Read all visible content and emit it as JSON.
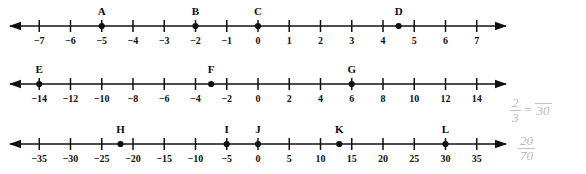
{
  "worksheet": {
    "title": "Number lines with labeled points",
    "ink_color": "#111111",
    "note_color": "#b9b9b9"
  },
  "number_lines": [
    {
      "id": "line-1",
      "top": 4,
      "min": -8,
      "max": 8,
      "tick_step": 1,
      "left_arrow": true,
      "right_arrow": true,
      "ticks": [
        {
          "value": -7,
          "label": "−7"
        },
        {
          "value": -6,
          "label": "−6"
        },
        {
          "value": -5,
          "label": "−5"
        },
        {
          "value": -4,
          "label": "−4"
        },
        {
          "value": -3,
          "label": "−3"
        },
        {
          "value": -2,
          "label": "−2"
        },
        {
          "value": -1,
          "label": "−1"
        },
        {
          "value": 0,
          "label": "0"
        },
        {
          "value": 1,
          "label": "1"
        },
        {
          "value": 2,
          "label": "2"
        },
        {
          "value": 3,
          "label": "3"
        },
        {
          "value": 4,
          "label": "4"
        },
        {
          "value": 5,
          "label": "5"
        },
        {
          "value": 6,
          "label": "6"
        },
        {
          "value": 7,
          "label": "7"
        }
      ],
      "points": [
        {
          "label": "A",
          "value": -5
        },
        {
          "label": "B",
          "value": -2
        },
        {
          "label": "C",
          "value": 0
        },
        {
          "label": "D",
          "value": 4.5
        }
      ]
    },
    {
      "id": "line-2",
      "top": 62,
      "min": -16,
      "max": 16,
      "tick_step": 2,
      "left_arrow": true,
      "right_arrow": true,
      "ticks": [
        {
          "value": -14,
          "label": "−14"
        },
        {
          "value": -12,
          "label": "−12"
        },
        {
          "value": -10,
          "label": "−10"
        },
        {
          "value": -8,
          "label": "−8"
        },
        {
          "value": -6,
          "label": "−6"
        },
        {
          "value": -4,
          "label": "−4"
        },
        {
          "value": -2,
          "label": "−2"
        },
        {
          "value": 0,
          "label": "0"
        },
        {
          "value": 2,
          "label": "2"
        },
        {
          "value": 4,
          "label": "4"
        },
        {
          "value": 6,
          "label": "6"
        },
        {
          "value": 8,
          "label": "8"
        },
        {
          "value": 10,
          "label": "10"
        },
        {
          "value": 12,
          "label": "12"
        },
        {
          "value": 14,
          "label": "14"
        }
      ],
      "points": [
        {
          "label": "E",
          "value": -14
        },
        {
          "label": "F",
          "value": -3
        },
        {
          "label": "G",
          "value": 6
        }
      ]
    },
    {
      "id": "line-3",
      "top": 122,
      "min": -40,
      "max": 40,
      "tick_step": 5,
      "left_arrow": true,
      "right_arrow": true,
      "ticks": [
        {
          "value": -35,
          "label": "−35"
        },
        {
          "value": -30,
          "label": "−30"
        },
        {
          "value": -25,
          "label": "−25"
        },
        {
          "value": -20,
          "label": "−20"
        },
        {
          "value": -15,
          "label": "−15"
        },
        {
          "value": -10,
          "label": "−10"
        },
        {
          "value": -5,
          "label": "−5"
        },
        {
          "value": 0,
          "label": "0"
        },
        {
          "value": 5,
          "label": "5"
        },
        {
          "value": 10,
          "label": "10"
        },
        {
          "value": 15,
          "label": "15"
        },
        {
          "value": 20,
          "label": "20"
        },
        {
          "value": 25,
          "label": "25"
        },
        {
          "value": 30,
          "label": "30"
        },
        {
          "value": 35,
          "label": "35"
        }
      ],
      "points": [
        {
          "label": "H",
          "value": -22
        },
        {
          "label": "I",
          "value": -5
        },
        {
          "label": "J",
          "value": 0
        },
        {
          "label": "K",
          "value": 13
        },
        {
          "label": "L",
          "value": 30
        }
      ]
    }
  ],
  "handwritten_notes": [
    {
      "id": "note-1",
      "numerator": "2",
      "denominator": "3",
      "equals": "=",
      "right_numerator": "",
      "right_denominator": "30",
      "right_text": "30"
    },
    {
      "id": "note-2",
      "numerator": "20",
      "denominator": "70"
    }
  ]
}
